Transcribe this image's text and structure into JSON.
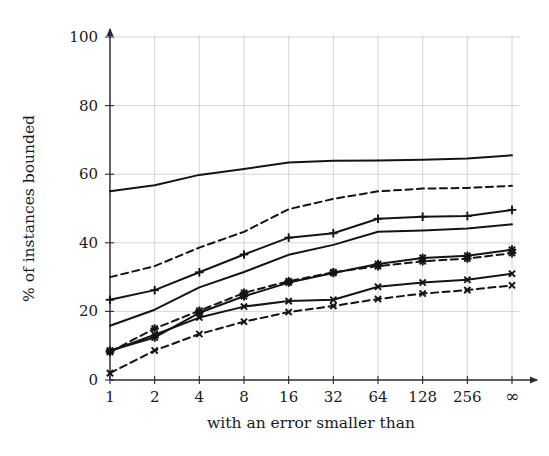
{
  "chart_data": {
    "type": "line",
    "title": "",
    "xlabel": "with an error smaller than",
    "ylabel": "% of instances bounded",
    "x_tick_labels": [
      "1",
      "2",
      "4",
      "8",
      "16",
      "32",
      "64",
      "128",
      "256",
      "∞"
    ],
    "x_positions": [
      0,
      1,
      2,
      3,
      4,
      5,
      6,
      7,
      8,
      9
    ],
    "y_tick_labels": [
      "0",
      "20",
      "40",
      "60",
      "80",
      "100"
    ],
    "y_ticks": [
      0,
      20,
      40,
      60,
      80,
      100
    ],
    "ylim": [
      0,
      100
    ],
    "xlim": [
      0,
      9
    ],
    "grid": true,
    "legend": "none",
    "series": [
      {
        "name": "series-1-solid-top",
        "style": "solid",
        "marker": "none",
        "color": "#141414",
        "values": [
          55.0,
          56.8,
          59.8,
          61.5,
          63.4,
          63.9,
          64.0,
          64.2,
          64.6,
          65.5
        ]
      },
      {
        "name": "series-2-dashed-upper",
        "style": "dashed",
        "marker": "none",
        "color": "#141414",
        "values": [
          30.0,
          33.2,
          38.6,
          43.2,
          49.8,
          52.8,
          55.0,
          55.8,
          56.0,
          56.6
        ]
      },
      {
        "name": "series-3-solid-plus",
        "style": "solid",
        "marker": "plus",
        "color": "#141414",
        "values": [
          23.4,
          26.2,
          31.4,
          36.6,
          41.5,
          42.8,
          47.0,
          47.6,
          47.8,
          49.6
        ]
      },
      {
        "name": "series-4-solid-plain",
        "style": "solid",
        "marker": "none",
        "color": "#141414",
        "values": [
          15.8,
          20.5,
          27.0,
          31.5,
          36.5,
          39.4,
          43.2,
          43.6,
          44.2,
          45.4
        ]
      },
      {
        "name": "series-5-solid-star",
        "style": "solid",
        "marker": "star",
        "color": "#141414",
        "values": [
          8.6,
          12.4,
          19.6,
          24.4,
          28.4,
          31.2,
          33.8,
          35.6,
          36.2,
          38.0
        ]
      },
      {
        "name": "series-6-dashed-star",
        "style": "dashed",
        "marker": "star",
        "color": "#141414",
        "values": [
          8.2,
          15.0,
          20.2,
          25.4,
          28.8,
          31.4,
          33.2,
          34.6,
          35.4,
          37.0
        ]
      },
      {
        "name": "series-7-solid-cross",
        "style": "solid",
        "marker": "cross",
        "color": "#141414",
        "values": [
          8.4,
          13.2,
          18.2,
          21.4,
          23.0,
          23.4,
          27.2,
          28.4,
          29.2,
          31.0
        ]
      },
      {
        "name": "series-8-dashed-cross",
        "style": "dashed",
        "marker": "cross",
        "color": "#141414",
        "values": [
          2.0,
          8.6,
          13.4,
          17.0,
          19.8,
          21.6,
          23.6,
          25.2,
          26.2,
          27.6
        ]
      }
    ]
  }
}
